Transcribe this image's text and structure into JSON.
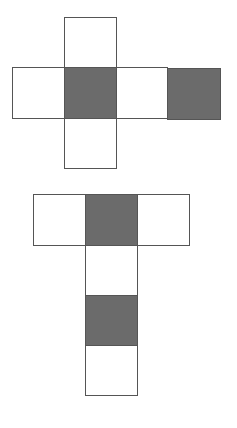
{
  "diagram": {
    "type": "cube-nets",
    "colors": {
      "shaded": "#6b6b6b",
      "empty": "#ffffff",
      "stroke": "#555555"
    },
    "nets": [
      {
        "name": "cross-net",
        "cells": [
          {
            "x": 64,
            "y": 17,
            "w": 52,
            "h": 50,
            "shaded": false
          },
          {
            "x": 12,
            "y": 67,
            "w": 52,
            "h": 51,
            "shaded": false
          },
          {
            "x": 64,
            "y": 67,
            "w": 52,
            "h": 51,
            "shaded": true
          },
          {
            "x": 116,
            "y": 67,
            "w": 51,
            "h": 51,
            "shaded": false
          },
          {
            "x": 167,
            "y": 68,
            "w": 53,
            "h": 51,
            "shaded": true
          },
          {
            "x": 64,
            "y": 118,
            "w": 52,
            "h": 50,
            "shaded": false
          }
        ]
      },
      {
        "name": "t-net",
        "cells": [
          {
            "x": 33,
            "y": 194,
            "w": 52,
            "h": 51,
            "shaded": false
          },
          {
            "x": 85,
            "y": 194,
            "w": 52,
            "h": 51,
            "shaded": true
          },
          {
            "x": 137,
            "y": 194,
            "w": 52,
            "h": 51,
            "shaded": false
          },
          {
            "x": 85,
            "y": 245,
            "w": 52,
            "h": 50,
            "shaded": false
          },
          {
            "x": 85,
            "y": 295,
            "w": 52,
            "h": 50,
            "shaded": true
          },
          {
            "x": 85,
            "y": 345,
            "w": 52,
            "h": 50,
            "shaded": false
          }
        ]
      }
    ]
  }
}
